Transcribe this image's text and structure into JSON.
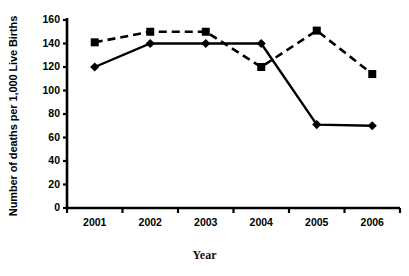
{
  "chart_data": {
    "type": "line",
    "title": "",
    "xlabel": "Year",
    "ylabel": "Number of deaths per 1,000 Live Births",
    "categories": [
      "2001",
      "2002",
      "2003",
      "2004",
      "2005",
      "2006"
    ],
    "ylim": [
      0,
      160
    ],
    "yticks": [
      0,
      20,
      40,
      60,
      80,
      100,
      120,
      140,
      160
    ],
    "ytick_labels": [
      "0",
      "20",
      "40",
      "60",
      "80",
      "100",
      "120",
      "140",
      "160"
    ],
    "grid": false,
    "legend": "none",
    "series": [
      {
        "name": "solid-series",
        "style": "solid",
        "marker": "diamond",
        "color": "#000000",
        "values": [
          120,
          140,
          140,
          140,
          71,
          70
        ]
      },
      {
        "name": "dashed-series",
        "style": "dashed",
        "marker": "square",
        "color": "#000000",
        "values": [
          141,
          150,
          150,
          120,
          151,
          114
        ]
      }
    ]
  },
  "axis": {
    "y_axis_name": "y-axis",
    "x_axis_name": "x-axis"
  }
}
